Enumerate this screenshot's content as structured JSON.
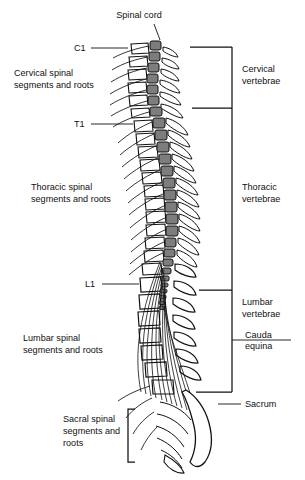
{
  "figure": {
    "background_color": "#ffffff",
    "ink_color": "#111111",
    "cord_color": "#7d7d7d",
    "bone_color": "#ffffff"
  },
  "callouts": {
    "spinal_cord": "Spinal cord",
    "sacrum": "Sacrum",
    "cauda_equina_line1": "Cauda",
    "cauda_equina_line2": "equina"
  },
  "vertebra_markers": {
    "c1": "C1",
    "t1": "T1",
    "l1": "L1"
  },
  "left_labels": {
    "cervical_line1": "Cervical spinal",
    "cervical_line2": "segments and roots",
    "thoracic_line1": "Thoracic spinal",
    "thoracic_line2": "segments and roots",
    "lumbar_line1": "Lumbar spinal",
    "lumbar_line2": "segments and roots",
    "sacral_line1": "Sacral spinal",
    "sacral_line2": "segments and",
    "sacral_line3": "roots"
  },
  "right_labels": {
    "cervical_line1": "Cervical",
    "cervical_line2": "vertebrae",
    "thoracic_line1": "Thoracic",
    "thoracic_line2": "vertebrae",
    "lumbar_line1": "Lumbar",
    "lumbar_line2": "vertebrae"
  }
}
